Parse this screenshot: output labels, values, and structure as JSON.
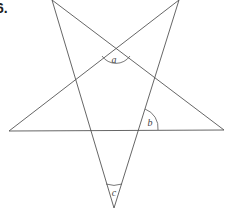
{
  "figure": {
    "number_label": "6."
  },
  "colors": {
    "line": "#555555",
    "arc": "#555555",
    "text": "#444444"
  },
  "vertices": {
    "top_left": [
      52,
      0
    ],
    "top_right": [
      179,
      0
    ],
    "left": [
      9,
      131
    ],
    "right": [
      224,
      130
    ],
    "bottom": [
      114,
      208
    ]
  },
  "lines": [
    [
      "top_left",
      "bottom"
    ],
    [
      "top_right",
      "left"
    ],
    [
      "left",
      "right"
    ],
    [
      "right",
      "top_left"
    ],
    [
      "top_right",
      "bottom"
    ]
  ],
  "angles": [
    {
      "label": "a",
      "label_pos": [
        114,
        63
      ],
      "arc": "M 102 56 A 17 17 0 0 0 130 56"
    },
    {
      "label": "b",
      "label_pos": [
        150,
        126
      ],
      "arc": "M 145 109 A 20 20 0 0 1 158 130"
    },
    {
      "label": "c",
      "label_pos": [
        114,
        196
      ],
      "arc": "M 106 184 A 24 24 0 0 0 122 184"
    }
  ]
}
